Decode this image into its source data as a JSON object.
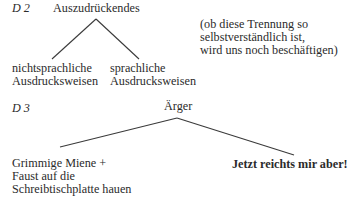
{
  "diagrams": [
    {
      "id_label": "D 2",
      "root": "Auszudrückendes",
      "children": [
        {
          "lines": [
            "nichtsprachliche",
            "Ausdrucksweisen"
          ]
        },
        {
          "lines": [
            "sprachliche",
            "Ausdrucksweisen"
          ]
        }
      ],
      "note": [
        "(ob diese Trennung so",
        "selbstverständlich ist,",
        "wird uns noch beschäftigen)"
      ]
    },
    {
      "id_label": "D 3",
      "root": "Ärger",
      "children": [
        {
          "lines": [
            "Grimmige Miene +",
            "Faust auf die",
            "Schreibtischplatte hauen"
          ]
        },
        {
          "lines": [
            "Jetzt reichts mir aber!"
          ],
          "bold": true
        }
      ]
    }
  ],
  "colors": {
    "text": "#2b2b2b",
    "line": "#3a3a3a",
    "background": "#ffffff"
  }
}
